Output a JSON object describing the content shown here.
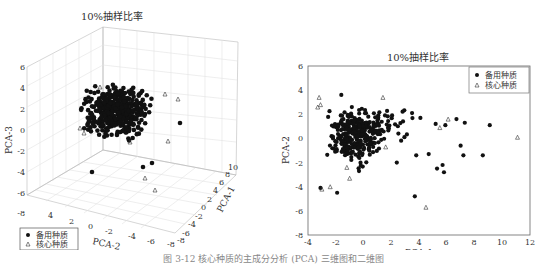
{
  "caption": "图 3-12  核心种质的主成分分析 (PCA) 三维图和二维图",
  "chart_data": [
    {
      "type": "scatter",
      "projection": "3d",
      "title": "10%抽样比率",
      "xlabel": "PCA-1",
      "ylabel": "PCA-2",
      "zlabel": "PCA-3",
      "x_ticks": [
        "-8",
        "-6",
        "-4",
        "-2",
        "0",
        "2",
        "4",
        "6",
        "8",
        "10"
      ],
      "y_ticks": [
        "4",
        "2",
        "0",
        "-2",
        "-4",
        "-6",
        "-8"
      ],
      "z_ticks": [
        "6",
        "4",
        "2",
        "0",
        "-2",
        "-4",
        "-6",
        "-8"
      ],
      "xlim": [
        -8,
        10
      ],
      "ylim": [
        -8,
        5
      ],
      "zlim": [
        -8,
        6
      ],
      "grid": true,
      "legend_position": "lower-left",
      "legend": [
        {
          "label": "备用种质",
          "marker": "filled-circle"
        },
        {
          "label": "核心种质",
          "marker": "open-triangle"
        }
      ]
    },
    {
      "type": "scatter",
      "title": "10%抽样比率",
      "xlabel": "PCA-1",
      "ylabel": "PCA-2",
      "x_ticks": [
        "-4",
        "-2",
        "0",
        "2",
        "4",
        "6",
        "8",
        "10",
        "12"
      ],
      "y_ticks": [
        "6",
        "4",
        "2",
        "0",
        "-2",
        "-4",
        "-6",
        "-8"
      ],
      "xlim": [
        -4,
        12
      ],
      "ylim": [
        -8,
        6
      ],
      "grid": false,
      "legend_position": "upper-right",
      "legend": [
        {
          "label": "备用种质",
          "marker": "filled-circle"
        },
        {
          "label": "核心种质",
          "marker": "open-triangle"
        }
      ],
      "series": [
        {
          "name": "备用种质",
          "note": "dense cluster around x∈[-3,2], y∈[-4,3.5]; outliers listed",
          "points": [
            [
              -3.1,
              -4.1
            ],
            [
              -1.9,
              -4.5
            ],
            [
              3.7,
              -4.8
            ],
            [
              7.0,
              -0.6
            ],
            [
              7.2,
              -1.4
            ],
            [
              8.6,
              -1.4
            ],
            [
              5.3,
              -2.5
            ],
            [
              5.7,
              -2.2
            ],
            [
              5.8,
              -2.8
            ],
            [
              4.7,
              -1.3
            ],
            [
              3.8,
              -1.4
            ],
            [
              6.7,
              1.6
            ],
            [
              7.3,
              1.3
            ],
            [
              9.1,
              1.1
            ],
            [
              5.9,
              1.1
            ],
            [
              5.2,
              1.2
            ],
            [
              4.1,
              1.7
            ],
            [
              3.5,
              2.1
            ],
            [
              -1.6,
              3.6
            ],
            [
              2.4,
              -2.0
            ]
          ]
        },
        {
          "name": "核心种质",
          "points": [
            [
              -3.0,
              -4.2
            ],
            [
              -2.4,
              -4.0
            ],
            [
              4.5,
              -5.7
            ],
            [
              11.1,
              0.1
            ],
            [
              6.1,
              1.6
            ],
            [
              5.5,
              0.9
            ],
            [
              1.4,
              3.4
            ],
            [
              -3.2,
              3.4
            ],
            [
              -3.1,
              2.8
            ],
            [
              -3.3,
              2.6
            ],
            [
              -1.2,
              -2.4
            ],
            [
              -1.0,
              -3.3
            ],
            [
              1.6,
              -0.7
            ]
          ]
        }
      ]
    }
  ]
}
